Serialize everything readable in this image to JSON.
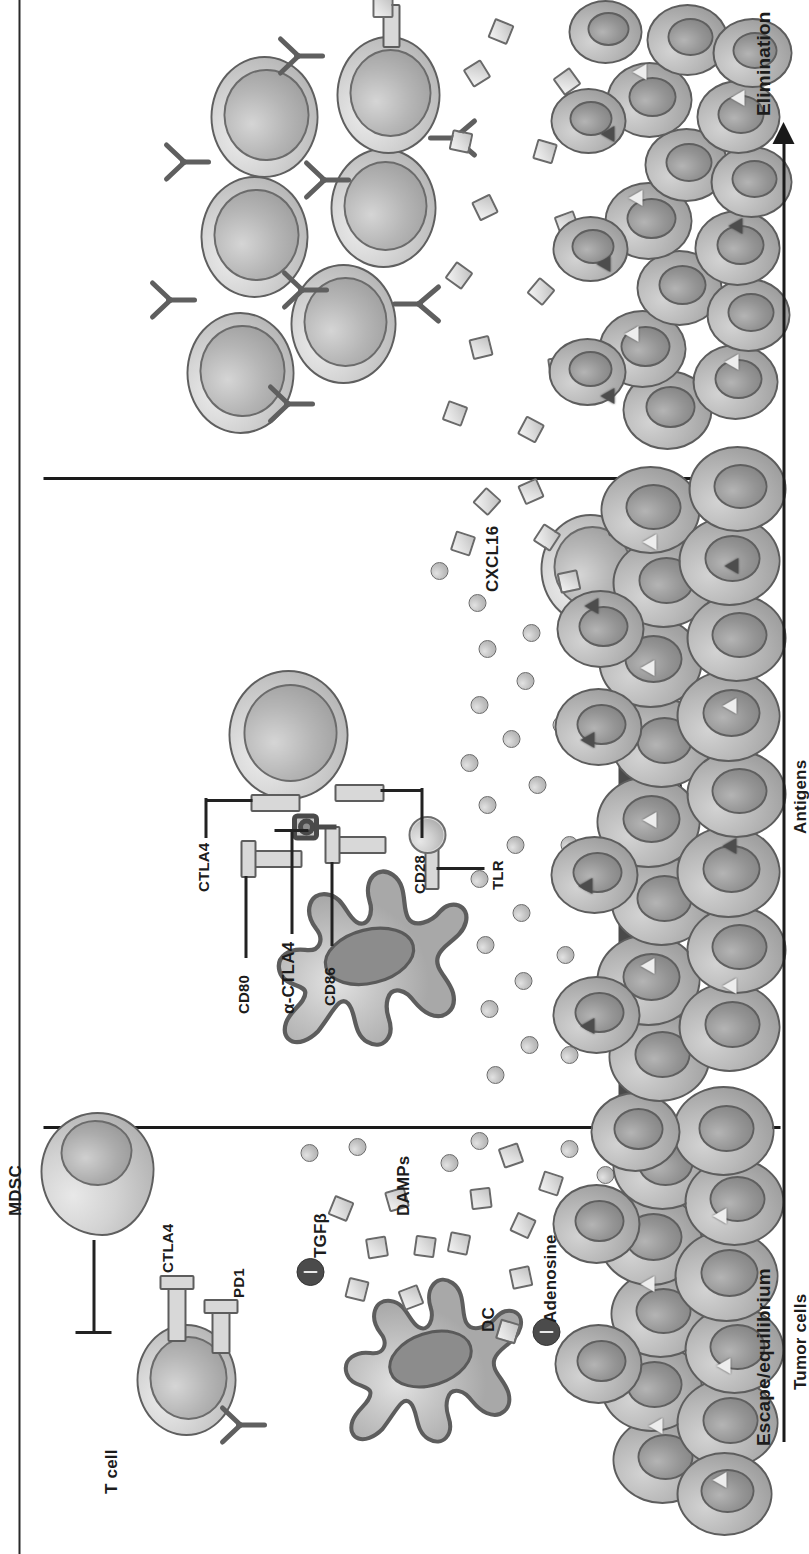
{
  "figure": {
    "orientation": "rotated-90-ccw",
    "background_color": "#ffffff"
  },
  "panels": [
    {
      "id": "escape",
      "outcome_label": "Escape/equilibrium"
    },
    {
      "id": "radiation",
      "outcome_label": "Radiation"
    },
    {
      "id": "elimination",
      "outcome_label": "Elimination"
    }
  ],
  "outcome_axis": {
    "left_label": "Escape/equilibrium",
    "right_label": "Elimination",
    "arrow_direction": "right"
  },
  "radiation_bar": {
    "label": "Radiation",
    "bar_color": "#4a4a4a",
    "text_color": "#ffffff",
    "icon": "lightning-bolt-icon"
  },
  "escape_panel": {
    "labels": {
      "t_cell": "T cell",
      "mdsc": "MDSC",
      "dendritic_cell": "DC",
      "pd1": "PD1",
      "ctla4": "CTLA4",
      "tgfb": "TGFβ",
      "adenosine": "Adenosine",
      "damps": "DAMPs",
      "tumor_cells": "Tumor cells"
    }
  },
  "radiation_panel": {
    "labels": {
      "anti_ctla4": "α-CTLA4",
      "ctla4": "CTLA4",
      "cd80": "CD80",
      "cd86": "CD86",
      "cd28": "CD28",
      "tlr": "TLR",
      "cxcl16": "CXCL16",
      "antigens": "Antigens"
    }
  },
  "elimination_panel": {
    "labels": {
      "outcome": "Elimination"
    }
  },
  "legend_colors": {
    "cell_fill": "#c8c8c8",
    "cell_outline": "#5f5f5f",
    "nucleus_fill": "#9a9a9a",
    "particle_fill": "#e0e0e0",
    "inhibitory_molecule": "#4b4b4b",
    "divider": "#1a1a1a"
  }
}
